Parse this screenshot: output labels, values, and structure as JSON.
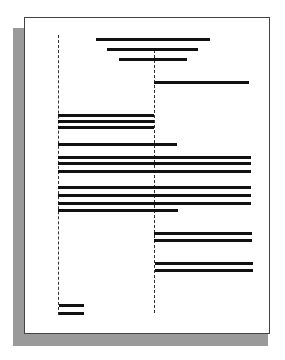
{
  "figure": {
    "colors": {
      "page": "#ffffff",
      "shadow": "#9a9a9a",
      "bars": "#111111",
      "guides": "#333333"
    },
    "guides": [
      {
        "name": "left-column-guide",
        "x": 58,
        "y1": 35,
        "y2": 315
      },
      {
        "name": "center-column-guide",
        "x": 154,
        "y1": 50,
        "y2": 313
      }
    ],
    "bars": [
      {
        "group": "title",
        "x1": 96,
        "x2": 210,
        "y": 39
      },
      {
        "group": "title",
        "x1": 107,
        "x2": 198,
        "y": 49
      },
      {
        "group": "title",
        "x1": 119,
        "x2": 187,
        "y": 59
      },
      {
        "group": "right-block-1",
        "x1": 154,
        "x2": 249,
        "y": 82
      },
      {
        "group": "left-block-1",
        "x1": 58,
        "x2": 154,
        "y": 115
      },
      {
        "group": "left-block-1",
        "x1": 58,
        "x2": 154,
        "y": 121
      },
      {
        "group": "left-block-1",
        "x1": 58,
        "x2": 154,
        "y": 127
      },
      {
        "group": "full-block",
        "x1": 58,
        "x2": 177,
        "y": 144
      },
      {
        "group": "full-block",
        "x1": 58,
        "x2": 251,
        "y": 157
      },
      {
        "group": "full-block",
        "x1": 58,
        "x2": 251,
        "y": 163
      },
      {
        "group": "full-block",
        "x1": 58,
        "x2": 251,
        "y": 171
      },
      {
        "group": "full-block-2",
        "x1": 58,
        "x2": 251,
        "y": 187
      },
      {
        "group": "full-block-2",
        "x1": 58,
        "x2": 251,
        "y": 195
      },
      {
        "group": "full-block-2",
        "x1": 58,
        "x2": 251,
        "y": 203
      },
      {
        "group": "full-block-2",
        "x1": 58,
        "x2": 178,
        "y": 210
      },
      {
        "group": "right-block-2",
        "x1": 154,
        "x2": 252,
        "y": 233
      },
      {
        "group": "right-block-2",
        "x1": 154,
        "x2": 252,
        "y": 240
      },
      {
        "group": "right-block-3",
        "x1": 155,
        "x2": 253,
        "y": 263
      },
      {
        "group": "right-block-3",
        "x1": 155,
        "x2": 253,
        "y": 270
      },
      {
        "group": "footer",
        "x1": 59,
        "x2": 84,
        "y": 305
      },
      {
        "group": "footer",
        "x1": 59,
        "x2": 84,
        "y": 313
      }
    ]
  }
}
